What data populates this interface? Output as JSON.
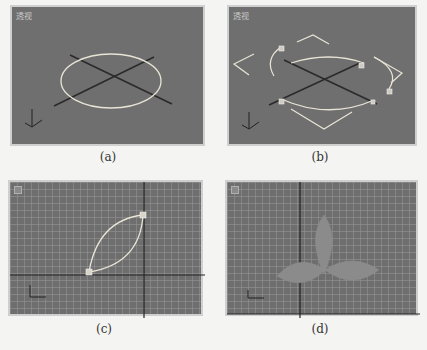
{
  "figure": {
    "panels": [
      {
        "id": "a",
        "caption": "(a)",
        "viewport_label": "透视",
        "view": "perspective",
        "content": "ellipse circle spline with crossed axis lines on grey ground"
      },
      {
        "id": "b",
        "caption": "(b)",
        "viewport_label": "透视",
        "view": "perspective",
        "content": "circle spline with vertex handles and bezier tangent handles"
      },
      {
        "id": "c",
        "caption": "(c)",
        "viewport_label": "",
        "view": "front (grid)",
        "content": "leaf-shaped closed spline with two vertices on grid"
      },
      {
        "id": "d",
        "caption": "(d)",
        "viewport_label": "",
        "view": "front (grid)",
        "content": "three leaf shapes arranged as a trefoil on grid"
      }
    ],
    "colors": {
      "viewport_bg": "#6f6f6f",
      "spline": "#e8e4d6",
      "axis_line": "#2a2a2a",
      "grid_line": "#969696",
      "leaf_fill": "#8a8a8a",
      "page_bg": "#f4f4f2"
    }
  }
}
